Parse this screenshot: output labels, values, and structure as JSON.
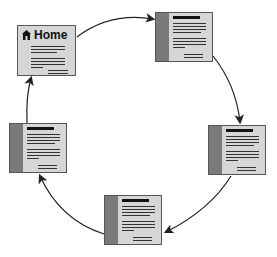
{
  "diagram": {
    "type": "cycle",
    "colors": {
      "page_fill": "#d6d6d6",
      "sidebar": "#7a7a7a",
      "border": "#555555",
      "arrow": "#222222"
    },
    "nodes": [
      {
        "id": "home",
        "label": "Home",
        "icon": "home-icon",
        "x": 17,
        "y": 25
      },
      {
        "id": "page-top-right",
        "label": "",
        "x": 155,
        "y": 12
      },
      {
        "id": "page-right",
        "label": "",
        "x": 208,
        "y": 125
      },
      {
        "id": "page-bottom",
        "label": "",
        "x": 104,
        "y": 195
      },
      {
        "id": "page-left",
        "label": "",
        "x": 9,
        "y": 123
      }
    ],
    "edges": [
      {
        "from": "home",
        "to": "page-top-right"
      },
      {
        "from": "page-top-right",
        "to": "page-right"
      },
      {
        "from": "page-right",
        "to": "page-bottom"
      },
      {
        "from": "page-bottom",
        "to": "page-left"
      },
      {
        "from": "page-left",
        "to": "home"
      }
    ]
  }
}
